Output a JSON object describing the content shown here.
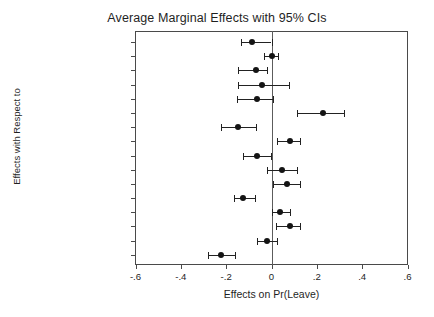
{
  "chart_data": {
    "type": "scatter",
    "title": "Average Marginal Effects with 95% CIs",
    "xlabel": "Effects on Pr(Leave)",
    "ylabel": "Effects with Respect to",
    "xlim": [
      -0.6,
      0.6
    ],
    "xticks": [
      "-.6",
      "-.4",
      "-.2",
      "0",
      ".2",
      ".4",
      ".6"
    ],
    "xtick_values": [
      -0.6,
      -0.4,
      -0.2,
      0,
      0.2,
      0.4,
      0.6
    ],
    "grid": false,
    "legend": "none",
    "zero_reference_line": 0,
    "categories": [
      "Age",
      "Gender",
      "Education",
      "Wealth",
      "Ideology",
      "Attach (UK-EU)",
      "Evaluation EU",
      "EU too centralized",
      "ARGJobs",
      "ARGImm",
      "ARGNHS",
      "POPCVCameron",
      "POPCVJohnson",
      "POPCVFarage",
      "POPCVCorbyn",
      "AngryLeave"
    ],
    "values": [
      -0.087,
      0.0,
      -0.07,
      -0.044,
      -0.065,
      0.225,
      -0.15,
      0.08,
      -0.063,
      0.048,
      0.068,
      -0.124,
      0.039,
      0.08,
      -0.019,
      -0.223
    ],
    "ci_low": [
      -0.134,
      -0.034,
      -0.149,
      -0.15,
      -0.152,
      0.112,
      -0.223,
      0.024,
      -0.124,
      -0.019,
      0.007,
      -0.165,
      0.0,
      0.019,
      -0.063,
      -0.281
    ],
    "ci_high": [
      0.0,
      0.028,
      -0.019,
      0.076,
      0.007,
      0.32,
      -0.069,
      0.124,
      -0.004,
      0.112,
      0.124,
      -0.073,
      0.08,
      0.124,
      0.024,
      -0.16
    ],
    "marker_color": "#141414",
    "line_color": "#222222",
    "axis_color": "#4a4a4a"
  }
}
